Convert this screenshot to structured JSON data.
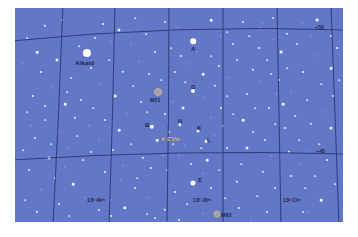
{
  "chart_data": {
    "type": "scatter",
    "xlabel": "Right Ascension",
    "ylabel": "Declination",
    "grid": true,
    "background_color": "#6277c6",
    "star_color": "#ffffff",
    "label_color": "#1c2550",
    "variable_star_color": "#e4cf7a",
    "ra_ticks": [
      {
        "label": "13ʰ 40ᵐ",
        "x": 94
      },
      {
        "label": "13ʰ 20ᵐ",
        "x": 200
      },
      {
        "label": "13ʰ 00ᵐ",
        "x": 288
      }
    ],
    "dec_ticks": [
      {
        "label": "+50",
        "y": 25
      },
      {
        "label": "+45",
        "y": 148
      }
    ],
    "named_stars": [
      {
        "label": "Alkaid",
        "x": 72,
        "y": 45,
        "mag": 1.9
      },
      {
        "label": "A",
        "x": 178,
        "y": 33,
        "mag": 3.0
      },
      {
        "label": "B",
        "x": 137,
        "y": 119,
        "mag": 3.2
      },
      {
        "label": "G",
        "x": 178,
        "y": 83,
        "mag": 3.6
      },
      {
        "label": "H",
        "x": 165,
        "y": 117,
        "mag": 4.0
      },
      {
        "label": "K",
        "x": 183,
        "y": 123,
        "mag": 4.2
      },
      {
        "label": "L",
        "x": 191,
        "y": 133,
        "mag": 4.4
      },
      {
        "label": "E",
        "x": 178,
        "y": 175,
        "mag": 3.8
      }
    ],
    "variable_stars": [
      {
        "label": "V CVn",
        "x": 176,
        "y": 131
      }
    ],
    "deep_sky_objects": [
      {
        "label": "M51",
        "x": 143,
        "y": 88,
        "type": "galaxy"
      },
      {
        "label": "M63",
        "x": 208,
        "y": 218,
        "type": "galaxy"
      }
    ],
    "stars": [
      [
        72,
        45,
        8.2,
        "b"
      ],
      [
        178,
        33,
        5.6,
        "b"
      ],
      [
        137,
        119,
        4.4,
        "b"
      ],
      [
        178,
        83,
        4.0,
        "b"
      ],
      [
        165,
        117,
        3.4,
        "m"
      ],
      [
        183,
        123,
        3.0,
        "m"
      ],
      [
        191,
        133,
        2.6,
        "m"
      ],
      [
        178,
        175,
        5.2,
        "b"
      ],
      [
        30,
        18,
        2.4,
        "m"
      ],
      [
        47,
        12,
        1.6,
        "d"
      ],
      [
        60,
        28,
        1.4,
        "d"
      ],
      [
        88,
        16,
        2.0,
        "m"
      ],
      [
        104,
        22,
        3.2,
        "m"
      ],
      [
        120,
        10,
        1.6,
        "d"
      ],
      [
        131,
        26,
        1.8,
        "d"
      ],
      [
        150,
        14,
        2.2,
        "m"
      ],
      [
        163,
        20,
        1.4,
        "d"
      ],
      [
        196,
        12,
        2.6,
        "m"
      ],
      [
        212,
        24,
        1.6,
        "d"
      ],
      [
        228,
        14,
        2.0,
        "m"
      ],
      [
        245,
        20,
        1.4,
        "d"
      ],
      [
        258,
        10,
        1.8,
        "d"
      ],
      [
        272,
        26,
        2.4,
        "m"
      ],
      [
        288,
        16,
        1.4,
        "d"
      ],
      [
        302,
        12,
        2.8,
        "m"
      ],
      [
        316,
        28,
        2.0,
        "m"
      ],
      [
        12,
        30,
        1.6,
        "d"
      ],
      [
        22,
        44,
        2.6,
        "m"
      ],
      [
        8,
        56,
        1.4,
        "d"
      ],
      [
        26,
        64,
        2.0,
        "m"
      ],
      [
        42,
        52,
        3.0,
        "m"
      ],
      [
        56,
        70,
        1.8,
        "d"
      ],
      [
        38,
        80,
        1.4,
        "d"
      ],
      [
        18,
        88,
        2.2,
        "m"
      ],
      [
        50,
        96,
        2.6,
        "m"
      ],
      [
        12,
        104,
        1.6,
        "d"
      ],
      [
        30,
        112,
        1.8,
        "d"
      ],
      [
        60,
        110,
        2.4,
        "m"
      ],
      [
        44,
        124,
        1.4,
        "d"
      ],
      [
        20,
        130,
        2.0,
        "m"
      ],
      [
        8,
        142,
        1.6,
        "d"
      ],
      [
        34,
        150,
        2.8,
        "m"
      ],
      [
        54,
        140,
        1.4,
        "d"
      ],
      [
        68,
        152,
        2.0,
        "m"
      ],
      [
        14,
        162,
        1.8,
        "d"
      ],
      [
        40,
        170,
        2.2,
        "m"
      ],
      [
        26,
        182,
        1.4,
        "d"
      ],
      [
        58,
        176,
        2.6,
        "m"
      ],
      [
        10,
        192,
        1.6,
        "d"
      ],
      [
        44,
        196,
        2.0,
        "m"
      ],
      [
        70,
        190,
        1.4,
        "d"
      ],
      [
        22,
        204,
        2.4,
        "m"
      ],
      [
        54,
        208,
        1.8,
        "d"
      ],
      [
        84,
        202,
        2.0,
        "m"
      ],
      [
        96,
        192,
        1.4,
        "d"
      ],
      [
        110,
        200,
        3.4,
        "m"
      ],
      [
        76,
        60,
        2.0,
        "m"
      ],
      [
        94,
        52,
        1.6,
        "d"
      ],
      [
        108,
        64,
        2.4,
        "m"
      ],
      [
        86,
        76,
        1.4,
        "d"
      ],
      [
        100,
        88,
        2.8,
        "m"
      ],
      [
        118,
        78,
        1.6,
        "d"
      ],
      [
        126,
        94,
        2.0,
        "m"
      ],
      [
        112,
        106,
        1.4,
        "d"
      ],
      [
        90,
        112,
        2.2,
        "m"
      ],
      [
        78,
        100,
        1.6,
        "d"
      ],
      [
        104,
        122,
        2.6,
        "m"
      ],
      [
        84,
        132,
        1.4,
        "d"
      ],
      [
        98,
        142,
        2.0,
        "m"
      ],
      [
        116,
        136,
        1.6,
        "d"
      ],
      [
        128,
        150,
        2.4,
        "m"
      ],
      [
        108,
        158,
        1.4,
        "d"
      ],
      [
        90,
        164,
        2.0,
        "m"
      ],
      [
        122,
        170,
        1.6,
        "d"
      ],
      [
        136,
        160,
        2.2,
        "m"
      ],
      [
        148,
        148,
        1.4,
        "d"
      ],
      [
        142,
        132,
        2.6,
        "m"
      ],
      [
        154,
        124,
        1.6,
        "d"
      ],
      [
        150,
        106,
        2.0,
        "m"
      ],
      [
        158,
        94,
        1.4,
        "d"
      ],
      [
        168,
        100,
        3.0,
        "m"
      ],
      [
        146,
        72,
        1.8,
        "d"
      ],
      [
        160,
        64,
        2.2,
        "m"
      ],
      [
        172,
        56,
        1.4,
        "d"
      ],
      [
        188,
        66,
        2.6,
        "m"
      ],
      [
        196,
        48,
        1.6,
        "d"
      ],
      [
        204,
        58,
        2.0,
        "m"
      ],
      [
        190,
        90,
        1.4,
        "d"
      ],
      [
        200,
        78,
        2.4,
        "m"
      ],
      [
        212,
        88,
        1.6,
        "d"
      ],
      [
        206,
        100,
        2.0,
        "m"
      ],
      [
        196,
        110,
        1.4,
        "d"
      ],
      [
        208,
        118,
        2.2,
        "m"
      ],
      [
        218,
        106,
        1.6,
        "d"
      ],
      [
        200,
        128,
        1.4,
        "d"
      ],
      [
        212,
        140,
        2.0,
        "m"
      ],
      [
        192,
        152,
        2.6,
        "m"
      ],
      [
        204,
        162,
        1.6,
        "d"
      ],
      [
        188,
        166,
        1.4,
        "d"
      ],
      [
        196,
        180,
        2.0,
        "m"
      ],
      [
        210,
        190,
        1.6,
        "d"
      ],
      [
        222,
        174,
        2.4,
        "m"
      ],
      [
        226,
        156,
        1.6,
        "d"
      ],
      [
        232,
        140,
        3.2,
        "m"
      ],
      [
        238,
        124,
        1.8,
        "d"
      ],
      [
        228,
        112,
        2.6,
        "m"
      ],
      [
        240,
        100,
        1.6,
        "d"
      ],
      [
        232,
        86,
        2.0,
        "m"
      ],
      [
        246,
        74,
        1.4,
        "d"
      ],
      [
        238,
        62,
        2.4,
        "m"
      ],
      [
        252,
        52,
        1.6,
        "d"
      ],
      [
        244,
        40,
        2.0,
        "m"
      ],
      [
        258,
        32,
        1.4,
        "d"
      ],
      [
        266,
        44,
        2.8,
        "m"
      ],
      [
        272,
        60,
        1.6,
        "d"
      ],
      [
        264,
        72,
        2.2,
        "m"
      ],
      [
        276,
        84,
        1.4,
        "d"
      ],
      [
        268,
        96,
        2.6,
        "m"
      ],
      [
        280,
        108,
        1.8,
        "d"
      ],
      [
        270,
        120,
        2.0,
        "m"
      ],
      [
        284,
        132,
        1.6,
        "d"
      ],
      [
        274,
        144,
        2.4,
        "m"
      ],
      [
        286,
        156,
        1.4,
        "d"
      ],
      [
        276,
        168,
        2.0,
        "m"
      ],
      [
        290,
        180,
        1.6,
        "d"
      ],
      [
        280,
        192,
        2.2,
        "m"
      ],
      [
        294,
        204,
        1.4,
        "d"
      ],
      [
        306,
        192,
        2.6,
        "m"
      ],
      [
        300,
        168,
        1.8,
        "d"
      ],
      [
        312,
        152,
        2.0,
        "m"
      ],
      [
        304,
        136,
        1.6,
        "d"
      ],
      [
        316,
        120,
        3.0,
        "m"
      ],
      [
        308,
        104,
        1.4,
        "d"
      ],
      [
        318,
        88,
        2.2,
        "m"
      ],
      [
        306,
        76,
        1.6,
        "d"
      ],
      [
        316,
        60,
        2.6,
        "m"
      ],
      [
        300,
        48,
        1.4,
        "d"
      ],
      [
        322,
        40,
        2.0,
        "m"
      ],
      [
        324,
        72,
        1.6,
        "d"
      ],
      [
        320,
        176,
        1.8,
        "d"
      ],
      [
        156,
        40,
        1.6,
        "d"
      ],
      [
        140,
        44,
        2.0,
        "m"
      ],
      [
        124,
        54,
        1.4,
        "d"
      ],
      [
        166,
        48,
        2.2,
        "m"
      ],
      [
        182,
        44,
        1.4,
        "d"
      ],
      [
        170,
        74,
        1.6,
        "d"
      ],
      [
        134,
        66,
        2.0,
        "m"
      ],
      [
        116,
        36,
        1.4,
        "d"
      ],
      [
        64,
        38,
        1.6,
        "d"
      ],
      [
        80,
        30,
        2.0,
        "m"
      ],
      [
        96,
        34,
        1.4,
        "d"
      ],
      [
        52,
        84,
        1.6,
        "d"
      ],
      [
        66,
        92,
        2.0,
        "m"
      ],
      [
        74,
        118,
        1.4,
        "d"
      ],
      [
        62,
        128,
        1.8,
        "d"
      ],
      [
        76,
        144,
        2.2,
        "m"
      ],
      [
        50,
        160,
        1.4,
        "d"
      ],
      [
        36,
        136,
        1.6,
        "d"
      ],
      [
        16,
        118,
        1.4,
        "d"
      ],
      [
        30,
        98,
        1.8,
        "d"
      ],
      [
        160,
        184,
        2.0,
        "m"
      ],
      [
        172,
        196,
        1.6,
        "d"
      ],
      [
        150,
        202,
        2.4,
        "m"
      ],
      [
        134,
        190,
        1.4,
        "d"
      ],
      [
        140,
        210,
        1.8,
        "d"
      ],
      [
        164,
        212,
        2.0,
        "m"
      ],
      [
        188,
        206,
        1.4,
        "d"
      ],
      [
        224,
        200,
        2.2,
        "m"
      ],
      [
        242,
        188,
        1.6,
        "d"
      ],
      [
        252,
        204,
        2.0,
        "m"
      ],
      [
        236,
        212,
        1.4,
        "d"
      ],
      [
        260,
        180,
        1.8,
        "d"
      ],
      [
        248,
        164,
        2.4,
        "m"
      ],
      [
        256,
        148,
        1.4,
        "d"
      ],
      [
        250,
        132,
        2.0,
        "m"
      ],
      [
        260,
        116,
        1.6,
        "d"
      ],
      [
        254,
        100,
        2.2,
        "m"
      ],
      [
        262,
        86,
        1.4,
        "d"
      ],
      [
        256,
        66,
        1.8,
        "d"
      ],
      [
        288,
        64,
        2.0,
        "m"
      ],
      [
        292,
        92,
        1.6,
        "d"
      ],
      [
        296,
        116,
        2.4,
        "m"
      ],
      [
        292,
        144,
        1.4,
        "d"
      ],
      [
        288,
        204,
        1.8,
        "d"
      ],
      [
        120,
        180,
        2.0,
        "m"
      ],
      [
        106,
        172,
        1.4,
        "d"
      ],
      [
        132,
        206,
        1.6,
        "d"
      ],
      [
        96,
        208,
        2.0,
        "m"
      ],
      [
        214,
        70,
        1.4,
        "d"
      ],
      [
        222,
        52,
        1.8,
        "d"
      ],
      [
        218,
        36,
        2.2,
        "m"
      ],
      [
        206,
        28,
        1.4,
        "d"
      ],
      [
        234,
        28,
        1.6,
        "d"
      ],
      [
        248,
        16,
        1.4,
        "d"
      ],
      [
        282,
        36,
        1.8,
        "d"
      ],
      [
        296,
        28,
        1.4,
        "d"
      ],
      [
        152,
        162,
        1.6,
        "d"
      ],
      [
        164,
        148,
        1.4,
        "d"
      ],
      [
        176,
        156,
        2.0,
        "m"
      ],
      [
        186,
        140,
        1.6,
        "d"
      ],
      [
        170,
        138,
        1.4,
        "d"
      ],
      [
        158,
        136,
        1.6,
        "d"
      ],
      [
        148,
        120,
        1.4,
        "d"
      ],
      [
        132,
        104,
        1.6,
        "d"
      ]
    ]
  },
  "labels": {
    "alkaid": "Alkaid",
    "m51": "M51",
    "m63": "M63",
    "vcvn": "V CVn",
    "a": "A",
    "b": "B",
    "g": "G",
    "h": "H",
    "k": "K",
    "l": "L",
    "e": "E",
    "dec50": "+50",
    "dec45": "+45",
    "ra1340": "13ʰ 40ᵐ",
    "ra1320": "13ʰ 20ᵐ",
    "ra1300": "13ʰ 00ᵐ"
  }
}
